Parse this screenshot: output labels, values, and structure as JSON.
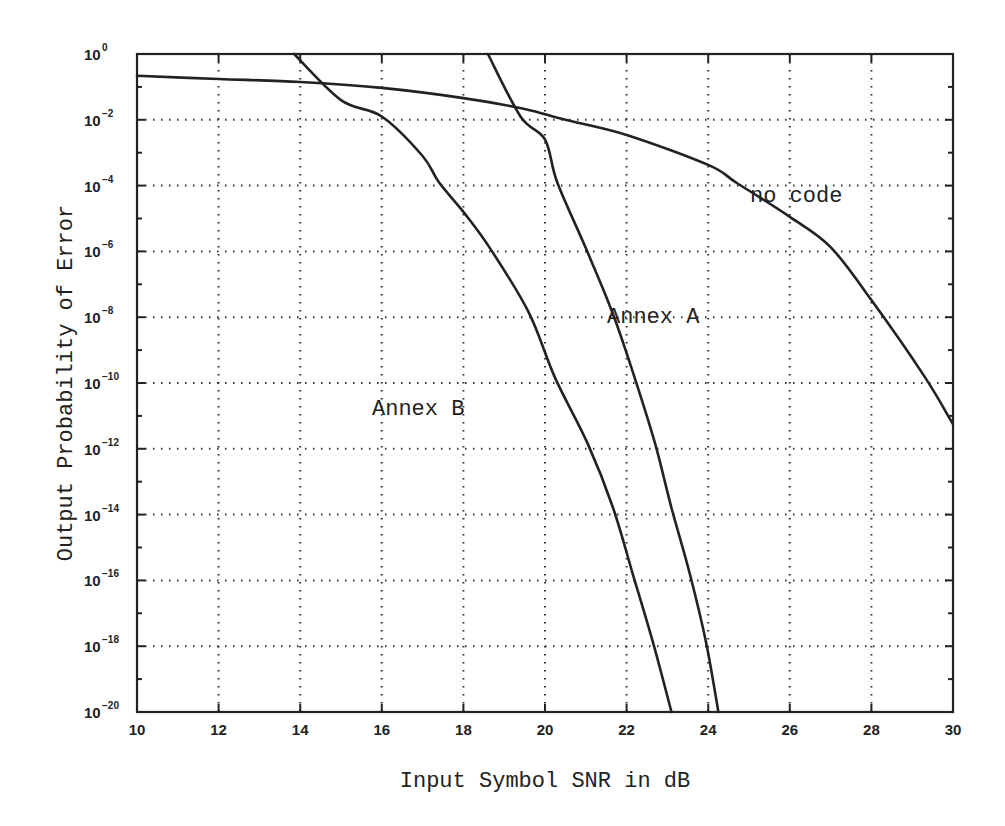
{
  "chart_data": {
    "type": "line",
    "title": "",
    "xlabel": "Input Symbol SNR in dB",
    "ylabel": "Output Probability of Error",
    "xscale": "linear",
    "yscale": "log",
    "xlim": [
      10,
      30
    ],
    "ylim": [
      1e-20,
      1
    ],
    "x_ticks": [
      10,
      12,
      14,
      16,
      18,
      20,
      22,
      24,
      26,
      28,
      30
    ],
    "y_ticks_exponents": [
      0,
      -2,
      -4,
      -6,
      -8,
      -10,
      -12,
      -14,
      -16,
      -18,
      -20
    ],
    "y_tick_labels": [
      "10^0",
      "10^-2",
      "10^-4",
      "10^-6",
      "10^-8",
      "10^-10",
      "10^-12",
      "10^-14",
      "10^-16",
      "10^-18",
      "10^-20"
    ],
    "grid": "dotted",
    "legend": "none (inline annotations)",
    "series": [
      {
        "name": "no code",
        "label_position": {
          "x": 25.0,
          "y_exp": -3.5
        },
        "points_log10": [
          [
            10,
            -0.66
          ],
          [
            12,
            -0.76
          ],
          [
            14,
            -0.85
          ],
          [
            16,
            -1.03
          ],
          [
            18,
            -1.34
          ],
          [
            19.5,
            -1.67
          ],
          [
            20.5,
            -2.0
          ],
          [
            22,
            -2.46
          ],
          [
            24,
            -3.37
          ],
          [
            24.7,
            -3.92
          ],
          [
            26,
            -4.95
          ],
          [
            27,
            -5.87
          ],
          [
            28,
            -7.48
          ],
          [
            29.3,
            -9.8
          ],
          [
            30,
            -11.25
          ]
        ]
      },
      {
        "name": "Annex A",
        "label_position": {
          "x": 21.8,
          "y_exp": -8.5
        },
        "points_log10": [
          [
            18.6,
            0
          ],
          [
            19.4,
            -1.9
          ],
          [
            20.0,
            -2.6
          ],
          [
            20.3,
            -3.9
          ],
          [
            21.0,
            -5.9
          ],
          [
            21.65,
            -7.85
          ],
          [
            22.2,
            -9.85
          ],
          [
            22.7,
            -11.85
          ],
          [
            23.1,
            -13.8
          ],
          [
            23.55,
            -15.8
          ],
          [
            23.95,
            -17.9
          ],
          [
            24.25,
            -20
          ]
        ]
      },
      {
        "name": "Annex B",
        "label_position": {
          "x": 15.7,
          "y_exp": -11.0
        },
        "points_log10": [
          [
            13.85,
            0
          ],
          [
            15.0,
            -1.4
          ],
          [
            16.0,
            -1.9
          ],
          [
            17.0,
            -3.1
          ],
          [
            17.4,
            -3.9
          ],
          [
            18.0,
            -4.8
          ],
          [
            18.65,
            -5.9
          ],
          [
            19.6,
            -7.85
          ],
          [
            20.25,
            -9.85
          ],
          [
            21.05,
            -11.85
          ],
          [
            21.67,
            -13.8
          ],
          [
            22.15,
            -15.8
          ],
          [
            22.65,
            -17.9
          ],
          [
            23.1,
            -20
          ]
        ]
      }
    ]
  },
  "labels": {
    "xlabel": "Input Symbol SNR in dB",
    "ylabel": "Output Probability of Error",
    "series_no_code": "no code",
    "series_annex_a": "Annex A",
    "series_annex_b": "Annex B"
  }
}
